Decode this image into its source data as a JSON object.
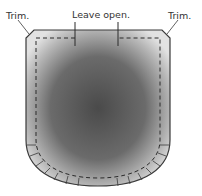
{
  "diagram": {
    "labels": {
      "trim_left": "Trim.",
      "leave_open": "Leave open.",
      "trim_right": "Trim."
    },
    "colors": {
      "outline": "#3a3a3a",
      "fill_center": "#4a4a4a",
      "fill_edge": "#e2e2e2",
      "dash": "#2a2a2a"
    }
  }
}
